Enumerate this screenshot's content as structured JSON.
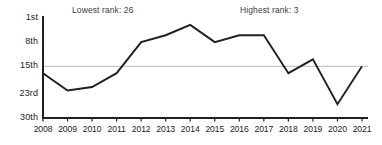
{
  "annotations": {
    "lowest": "Lowest rank: 26",
    "highest": "Highest rank: 3"
  },
  "chart_data": {
    "type": "line",
    "title": "",
    "subtitle": "",
    "xlabel": "",
    "ylabel": "",
    "categories": [
      "2008",
      "2009",
      "2010",
      "2011",
      "2012",
      "2013",
      "2014",
      "2015",
      "2016",
      "2017",
      "2018",
      "2019",
      "2020",
      "2021"
    ],
    "values": [
      17,
      22,
      21,
      17,
      8,
      6,
      3,
      8,
      6,
      6,
      17,
      13,
      26,
      15
    ],
    "series": [
      {
        "name": "Rank",
        "values": [
          17,
          22,
          21,
          17,
          8,
          6,
          3,
          8,
          6,
          6,
          17,
          13,
          26,
          15
        ]
      }
    ],
    "y_tick_labels": [
      "1st",
      "8th",
      "15th",
      "23rd",
      "30th"
    ],
    "y_tick_values": [
      1,
      8,
      15,
      23,
      30
    ],
    "ylim": [
      1,
      30
    ],
    "y_inverted": true,
    "gridlines": [
      15
    ],
    "grid": true,
    "legend": "none",
    "line_color": "#231f20",
    "grid_color": "#c9c9c9",
    "axis_color": "#231f20",
    "lowest_rank": 26,
    "highest_rank": 3,
    "lowest_rank_year": "2020",
    "highest_rank_year": "2014"
  },
  "colors": {
    "line": "#231f20",
    "grid": "#c9c9c9",
    "axis": "#231f20",
    "text": "#1b1b1b",
    "annotation_text": "#3c3c3c",
    "background": "#ffffff"
  }
}
